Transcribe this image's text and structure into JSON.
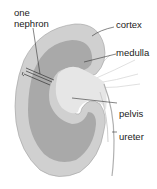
{
  "diagram": {
    "labels": {
      "nephron_line1": "one",
      "nephron_line2": "nephron",
      "cortex": "cortex",
      "medulla": "medulla",
      "pelvis": "pelvis",
      "ureter": "ureter"
    },
    "colors": {
      "cortex": "#cfcfcf",
      "medulla": "#a9a9a9",
      "pelvis": "#e6e6e6",
      "outline": "#9a9a9a",
      "leader": "#333333",
      "background": "#ffffff"
    }
  }
}
